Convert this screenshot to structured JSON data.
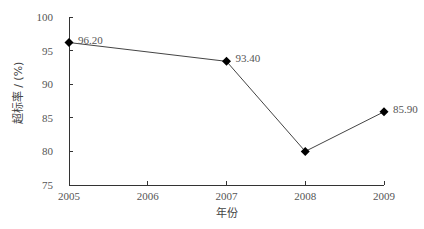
{
  "chart_data": {
    "type": "line",
    "title": "",
    "xlabel": "年份",
    "ylabel": "超标率 / (%)",
    "categories": [
      "2005",
      "2006",
      "2007",
      "2008",
      "2009"
    ],
    "ylim": [
      75,
      100
    ],
    "yticks": [
      75,
      80,
      85,
      90,
      95,
      100
    ],
    "grid": false,
    "legend": "none",
    "series": [
      {
        "name": "超标率",
        "points": [
          {
            "x": "2005",
            "y": 96.2,
            "label": "96.20"
          },
          {
            "x": "2007",
            "y": 93.4,
            "label": "93.40"
          },
          {
            "x": "2008",
            "y": 80.0,
            "label": null
          },
          {
            "x": "2009",
            "y": 85.9,
            "label": "85.90"
          }
        ],
        "color": "#444444",
        "marker": "diamond",
        "marker_color": "#000000"
      }
    ]
  }
}
